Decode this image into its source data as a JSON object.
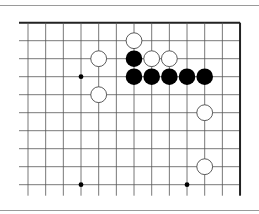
{
  "diagram": {
    "type": "go-board-fragment",
    "grid": {
      "origin_x": 28,
      "origin_y": 22.7,
      "step_x": 17.67,
      "step_y": 18,
      "cols": 13,
      "rows": 10,
      "edges": {
        "top": true,
        "right": true,
        "left": false,
        "bottom": false
      }
    },
    "colors": {
      "line": "#555555",
      "edge": "#222222",
      "black_stone": "#000000",
      "white_stone_fill": "#ffffff",
      "white_stone_stroke": "#333333",
      "rule": "#9a9a9a"
    },
    "hoshi": [
      {
        "col": 3,
        "row": 3
      },
      {
        "col": 3,
        "row": 9
      },
      {
        "col": 9,
        "row": 9
      }
    ],
    "stones": [
      {
        "color": "white",
        "col": 6,
        "row": 1
      },
      {
        "color": "white",
        "col": 4,
        "row": 2
      },
      {
        "color": "black",
        "col": 6,
        "row": 2
      },
      {
        "color": "white",
        "col": 7,
        "row": 2
      },
      {
        "color": "white",
        "col": 8,
        "row": 2
      },
      {
        "color": "black",
        "col": 6,
        "row": 3
      },
      {
        "color": "black",
        "col": 7,
        "row": 3
      },
      {
        "color": "black",
        "col": 8,
        "row": 3
      },
      {
        "color": "black",
        "col": 9,
        "row": 3
      },
      {
        "color": "black",
        "col": 10,
        "row": 3
      },
      {
        "color": "white",
        "col": 4,
        "row": 4
      },
      {
        "color": "white",
        "col": 10,
        "row": 5
      },
      {
        "color": "white",
        "col": 10,
        "row": 8
      }
    ]
  }
}
